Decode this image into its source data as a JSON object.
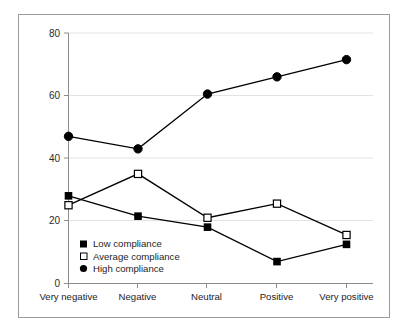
{
  "chart_data": {
    "type": "line",
    "title": "",
    "subtitle": "",
    "xlabel": "",
    "ylabel": "",
    "categories": [
      "Very negative",
      "Negative",
      "Neutral",
      "Positive",
      "Very positive"
    ],
    "yticks": [
      0,
      20,
      40,
      60,
      80
    ],
    "ytick_labels": [
      "0",
      "20",
      "40",
      "60",
      "80"
    ],
    "ylim": [
      0,
      80
    ],
    "grid": "horizontal",
    "legend_position": "inside-lower-left",
    "series": [
      {
        "name": "Low compliance",
        "marker": "filled-square",
        "color": "#000000",
        "values": [
          28,
          21.5,
          18,
          7,
          12.5
        ]
      },
      {
        "name": "Average compliance",
        "marker": "open-square",
        "color": "#000000",
        "values": [
          25,
          35,
          21,
          25.5,
          15.5
        ]
      },
      {
        "name": "High compliance",
        "marker": "filled-circle",
        "color": "#000000",
        "values": [
          47,
          43,
          60.5,
          66,
          71.5
        ]
      }
    ]
  },
  "axis": {
    "tick_0": "0",
    "tick_20": "20",
    "tick_40": "40",
    "tick_60": "60",
    "tick_80": "80"
  },
  "categories": {
    "c0": "Very negative",
    "c1": "Negative",
    "c2": "Neutral",
    "c3": "Positive",
    "c4": "Very positive"
  },
  "legend": {
    "item0": "Low compliance",
    "item1": "Average compliance",
    "item2": "High compliance"
  },
  "colors": {
    "line": "#000000",
    "grid": "#e3e3e3",
    "axis": "#8c8c8c",
    "frame": "#9a9a9a",
    "background": "#ffffff",
    "text": "#1d1d1d"
  }
}
